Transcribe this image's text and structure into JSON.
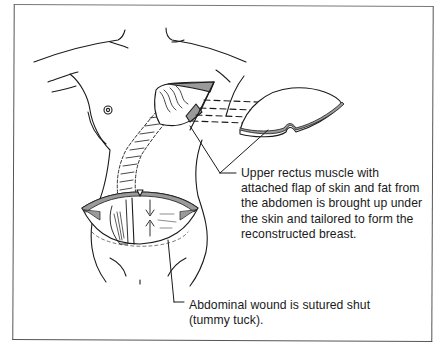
{
  "figure": {
    "callouts": [
      {
        "id": "flap",
        "lines": [
          "Upper rectus muscle with",
          "attached flap of skin and fat from",
          "the abdomen is brought up under",
          "the skin and tailored to form the",
          "reconstructed breast."
        ]
      },
      {
        "id": "wound",
        "lines": [
          "Abdominal wound is sutured shut",
          "(tummy tuck)."
        ]
      }
    ]
  },
  "colors": {
    "ink": "#1a1a1a",
    "frame": "#555555",
    "background": "#ffffff",
    "shade": "#9a9a9a"
  }
}
